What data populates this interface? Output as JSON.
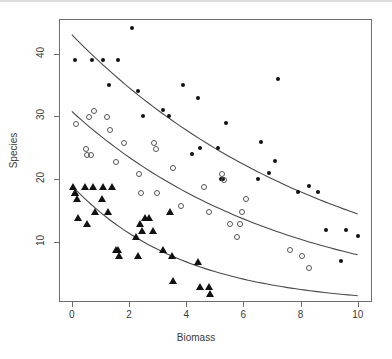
{
  "chart_data": {
    "type": "scatter",
    "title": "",
    "xlabel": "Biomass",
    "ylabel": "Species",
    "xlim": [
      -0.45,
      10.5
    ],
    "ylim": [
      0.5,
      45.5
    ],
    "xticks": [
      0,
      2,
      4,
      6,
      8,
      10
    ],
    "yticks": [
      10,
      20,
      30,
      40
    ],
    "grid": false,
    "legend": "none",
    "series": [
      {
        "name": "pH high",
        "marker": "filled-circle",
        "points": [
          [
            0.1,
            39
          ],
          [
            0.7,
            39
          ],
          [
            1.1,
            39
          ],
          [
            1.6,
            39
          ],
          [
            1.3,
            35
          ],
          [
            2.1,
            44
          ],
          [
            2.3,
            34
          ],
          [
            2.5,
            30
          ],
          [
            3.2,
            31
          ],
          [
            3.4,
            30
          ],
          [
            3.9,
            35
          ],
          [
            4.4,
            33
          ],
          [
            4.2,
            24
          ],
          [
            4.5,
            25
          ],
          [
            5.1,
            25
          ],
          [
            5.4,
            29
          ],
          [
            5.3,
            20
          ],
          [
            5.2,
            20
          ],
          [
            6.5,
            20
          ],
          [
            6.6,
            26
          ],
          [
            7.1,
            23
          ],
          [
            7.2,
            36
          ],
          [
            6.9,
            21
          ],
          [
            7.9,
            18
          ],
          [
            8.3,
            19
          ],
          [
            8.6,
            18
          ],
          [
            8.9,
            12
          ],
          [
            9.4,
            7
          ],
          [
            9.6,
            12
          ],
          [
            10.0,
            11
          ]
        ]
      },
      {
        "name": "pH mid",
        "marker": "open-circle",
        "points": [
          [
            0.1,
            29
          ],
          [
            0.55,
            30
          ],
          [
            0.75,
            31
          ],
          [
            1.2,
            30
          ],
          [
            1.3,
            28
          ],
          [
            0.45,
            25
          ],
          [
            0.5,
            24
          ],
          [
            0.62,
            24
          ],
          [
            1.5,
            23
          ],
          [
            1.8,
            26
          ],
          [
            2.3,
            21
          ],
          [
            2.4,
            18
          ],
          [
            2.85,
            26
          ],
          [
            2.9,
            25
          ],
          [
            2.95,
            18
          ],
          [
            3.5,
            22
          ],
          [
            3.8,
            16
          ],
          [
            4.6,
            19
          ],
          [
            4.75,
            15
          ],
          [
            5.2,
            21
          ],
          [
            5.3,
            20
          ],
          [
            5.5,
            13
          ],
          [
            5.85,
            13
          ],
          [
            5.9,
            15
          ],
          [
            5.75,
            11
          ],
          [
            6.05,
            17
          ],
          [
            7.6,
            9
          ],
          [
            8.0,
            8
          ],
          [
            8.25,
            6
          ]
        ]
      },
      {
        "name": "pH low",
        "marker": "triangle",
        "points": [
          [
            0.05,
            19
          ],
          [
            0.1,
            18
          ],
          [
            0.12,
            18
          ],
          [
            0.18,
            17
          ],
          [
            0.2,
            14
          ],
          [
            0.45,
            19
          ],
          [
            0.52,
            13
          ],
          [
            0.75,
            19
          ],
          [
            0.8,
            15
          ],
          [
            1.05,
            17
          ],
          [
            1.1,
            19
          ],
          [
            1.25,
            15
          ],
          [
            1.4,
            19
          ],
          [
            1.55,
            9
          ],
          [
            1.6,
            9
          ],
          [
            1.65,
            8
          ],
          [
            2.25,
            11
          ],
          [
            2.3,
            8
          ],
          [
            2.4,
            13
          ],
          [
            2.45,
            12
          ],
          [
            2.55,
            14
          ],
          [
            2.7,
            14
          ],
          [
            2.85,
            12
          ],
          [
            3.2,
            9
          ],
          [
            3.45,
            15
          ],
          [
            3.5,
            8
          ],
          [
            3.55,
            4
          ],
          [
            4.4,
            7
          ],
          [
            4.5,
            3
          ],
          [
            4.8,
            3
          ],
          [
            4.85,
            2
          ]
        ]
      }
    ],
    "curves": [
      {
        "name": "fit-high",
        "description": "fitted exponential decline for the filled-circle series",
        "y0": 43,
        "y_end": 14.5
      },
      {
        "name": "fit-mid",
        "description": "fitted exponential decline for the open-circle series",
        "y0": 30.8,
        "y_end": 8
      },
      {
        "name": "fit-low",
        "description": "fitted exponential decline for the triangle series",
        "y0": 19,
        "y_end": 1.5
      }
    ]
  }
}
